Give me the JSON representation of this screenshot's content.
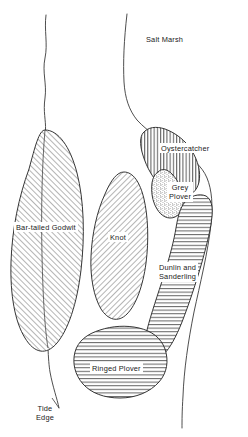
{
  "figure": {
    "type": "hand-drawn distribution map",
    "background_color": "#ffffff",
    "ink_color": "#2b2b2b"
  },
  "labels": {
    "salt_marsh": "Salt Marsh",
    "oystercatcher": "Oystercatcher",
    "grey_plover_line1": "Grey",
    "grey_plover_line2": "Plover",
    "dunlin_line1": "Dunlin and",
    "dunlin_line2": "Sanderling",
    "bar_tailed_godwit": "Bar-tailed Godwit",
    "knot": "Knot",
    "ringed_plover": "Ringed Plover",
    "tide_edge_line1": "Tide",
    "tide_edge_line2": "Edge"
  },
  "regions": [
    {
      "name": "salt-marsh",
      "label": "Salt Marsh",
      "fill": "none",
      "hatch": "none"
    },
    {
      "name": "oystercatcher",
      "label": "Oystercatcher",
      "fill": "vertical-hatch",
      "hatch": "vertical"
    },
    {
      "name": "grey-plover",
      "label": "Grey Plover",
      "fill": "stipple",
      "hatch": "dots"
    },
    {
      "name": "dunlin-sanderling",
      "label": "Dunlin and Sanderling",
      "fill": "horizontal-hatch",
      "hatch": "horizontal"
    },
    {
      "name": "bar-tailed-godwit",
      "label": "Bar-tailed Godwit",
      "fill": "diagonal-hatch-up",
      "hatch": "diagonal-up"
    },
    {
      "name": "knot",
      "label": "Knot",
      "fill": "diagonal-hatch-down",
      "hatch": "diagonal-down"
    },
    {
      "name": "ringed-plover",
      "label": "Ringed Plover",
      "fill": "horizontal-hatch",
      "hatch": "horizontal"
    }
  ],
  "boundaries": [
    {
      "name": "tide-edge",
      "label": "Tide Edge",
      "style": "thin wavy line, vertical, left side"
    },
    {
      "name": "salt-marsh-edge",
      "label": "Salt Marsh",
      "style": "thin curved line, right side"
    }
  ]
}
